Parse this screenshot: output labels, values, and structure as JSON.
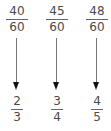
{
  "columns": [
    {
      "from": {
        "numerator": "40",
        "denominator": "60"
      },
      "to": {
        "numerator": "2",
        "denominator": "3"
      }
    },
    {
      "from": {
        "numerator": "45",
        "denominator": "60"
      },
      "to": {
        "numerator": "3",
        "denominator": "4"
      }
    },
    {
      "from": {
        "numerator": "48",
        "denominator": "60"
      },
      "to": {
        "numerator": "4",
        "denominator": "5"
      }
    }
  ],
  "colors": {
    "text": "#4a4a4a",
    "arrow_shaft": "#777777",
    "arrow_head": "#111111"
  }
}
